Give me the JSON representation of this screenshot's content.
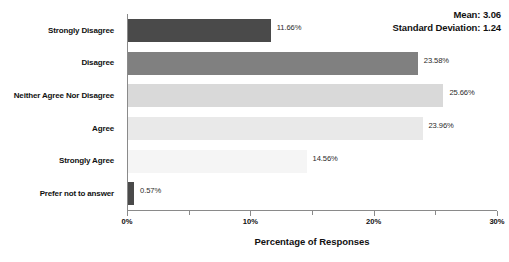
{
  "chart_data": {
    "type": "bar",
    "orientation": "horizontal",
    "title": "",
    "xlabel": "Percentage of Responses",
    "ylabel": "",
    "xlim": [
      0,
      30
    ],
    "xtick_labels": [
      "0%",
      "10%",
      "20%",
      "30%"
    ],
    "xtick_values": [
      0,
      10,
      20,
      30
    ],
    "minor_tick_values": [
      5,
      15,
      25
    ],
    "grid": false,
    "legend": false,
    "categories": [
      "Strongly Disagree",
      "Disagree",
      "Neither Agree Nor Disagree",
      "Agree",
      "Strongly Agree",
      "Prefer not to answer"
    ],
    "values": [
      11.66,
      23.58,
      25.66,
      23.96,
      14.56,
      0.57
    ],
    "value_labels": [
      "11.66%",
      "23.58%",
      "25.66%",
      "23.96%",
      "14.56%",
      "0.57%"
    ],
    "bar_colors": [
      "#4a4a4a",
      "#808080",
      "#d9d9d9",
      "#e9e9e9",
      "#f5f5f5",
      "#4a4a4a"
    ],
    "annotations": {
      "mean_label": "Mean: 3.06",
      "std_label": "Standard Deviation: 1.24",
      "mean_value": 3.06,
      "std_value": 1.24
    }
  }
}
